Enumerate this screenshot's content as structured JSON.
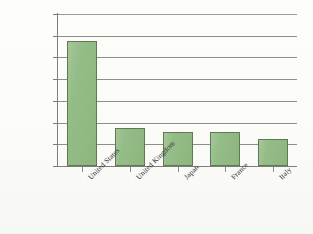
{
  "chart_data": {
    "type": "bar",
    "title": "",
    "subtitle": "",
    "xlabel": "",
    "ylabel": "",
    "categories": [
      "United States",
      "United Kingdom",
      "Japan",
      "France",
      "Italy"
    ],
    "values": [
      1150000,
      350000,
      315000,
      310000,
      250000
    ],
    "ylim": [
      0,
      1400000
    ],
    "ytick_values": [
      0,
      200000,
      400000,
      600000,
      800000,
      1000000,
      1200000,
      1400000
    ],
    "ytick_labels": [
      "0",
      "200,000",
      "400,000",
      "600,000",
      "800,000",
      "1,000,000",
      "1,200,000",
      "1,400,000"
    ],
    "grid": true,
    "grid_axis": "y",
    "legend": false,
    "legend_position": "none",
    "bar_fill_color": "#92bb84",
    "bar_border_color": "#5e7a52",
    "gridline_color": "#8d8d8d",
    "axis_color": "#7d7d7d",
    "background_color": "#fdfdfb",
    "xtick_label_rotation": -45
  }
}
